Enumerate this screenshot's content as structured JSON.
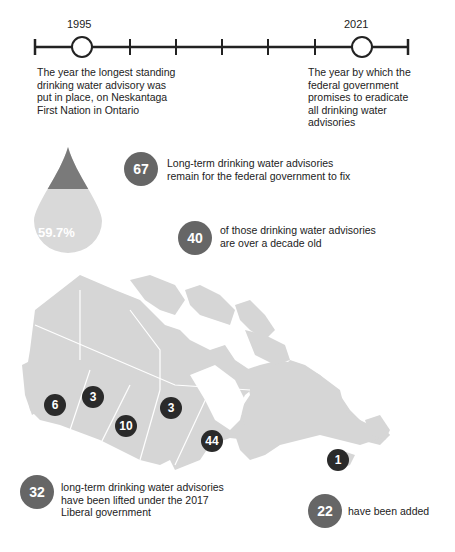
{
  "timeline": {
    "start_year": "1995",
    "end_year": "2021",
    "start_caption": [
      "The year the longest standing",
      "drinking water advisory was",
      "put in place, on Neskantaga",
      "First Nation in Ontario"
    ],
    "end_caption": [
      "The year by which the",
      "federal government",
      "promises to eradicate",
      "all drinking water",
      "advisories"
    ]
  },
  "droplet": {
    "percent_label": "59.7%",
    "filled_fraction": 0.597,
    "colors": {
      "top": "#7a7a7a",
      "bottom": "#d9d9d9"
    }
  },
  "stats": [
    {
      "value": "67",
      "text": [
        "Long-term drinking water advisories",
        "remain for the federal government to fix"
      ]
    },
    {
      "value": "40",
      "text": [
        "of those drinking water advisories",
        "are over a decade old"
      ]
    },
    {
      "value": "32",
      "text": [
        "long-term drinking water advisories",
        "have been lifted under the 2017",
        "Liberal government"
      ]
    },
    {
      "value": "22",
      "text": [
        "have been added"
      ]
    }
  ],
  "map": {
    "land_color": "#d6d6d6",
    "marker_color": "#2a2a2a",
    "markers": [
      {
        "region": "British Columbia",
        "value": "6"
      },
      {
        "region": "Alberta",
        "value": "3"
      },
      {
        "region": "Saskatchewan",
        "value": "10"
      },
      {
        "region": "Manitoba",
        "value": "3"
      },
      {
        "region": "Ontario",
        "value": "44"
      },
      {
        "region": "Nova Scotia",
        "value": "1"
      }
    ]
  },
  "colors": {
    "stat_circle": "#666666",
    "text": "#222222"
  }
}
